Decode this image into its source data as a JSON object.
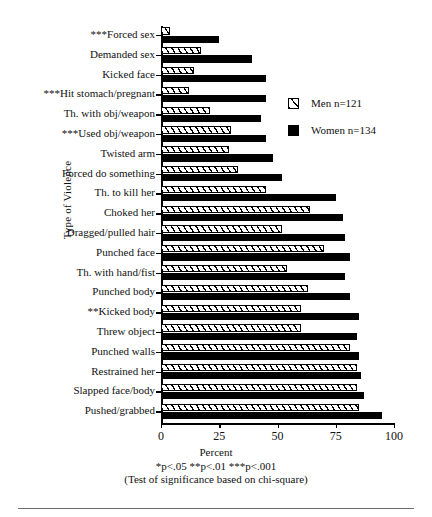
{
  "chart_data": {
    "type": "bar",
    "orientation": "horizontal",
    "title": "",
    "xlabel": "Percent",
    "ylabel": "Type of Violence",
    "xlim": [
      0,
      100
    ],
    "xticks": [
      0,
      25,
      50,
      75,
      100
    ],
    "grid": false,
    "legend_position": "upper right",
    "categories": [
      "***Forced sex",
      "Demanded sex",
      "Kicked face",
      "***Hit stomach/pregnant",
      "Th. with obj/weapon",
      "***Used obj/weapon",
      "Twisted arm",
      "Forced do something",
      "Th. to kill her",
      "Choked her",
      "Dragged/pulled hair",
      "Punched face",
      "Th. with hand/fist",
      "Punched body",
      "**Kicked body",
      "Threw object",
      "Punched walls",
      "Restrained her",
      "Slapped face/body",
      "Pushed/grabbed"
    ],
    "series": [
      {
        "name": "Men n=121",
        "pattern": "hatched",
        "values": [
          4,
          17,
          14,
          12,
          21,
          30,
          29,
          33,
          45,
          64,
          52,
          70,
          54,
          63,
          60,
          60,
          81,
          84,
          84,
          85
        ]
      },
      {
        "name": "Women n=134",
        "pattern": "solid",
        "color": "#000000",
        "values": [
          25,
          39,
          45,
          45,
          43,
          45,
          48,
          52,
          75,
          78,
          79,
          81,
          79,
          81,
          85,
          84,
          85,
          86,
          87,
          95
        ]
      }
    ],
    "annotations": [
      "*p<.05 **p<.01 ***p<.001",
      "(Test of significance based on  chi-square)"
    ]
  },
  "legend": {
    "items": [
      {
        "label": "Men n=121",
        "swatch": "hatched-square-icon"
      },
      {
        "label": "Women n=134",
        "swatch": "filled-square-icon"
      }
    ]
  },
  "footer": {
    "xlabel": "Percent",
    "significance": "*p<.05 **p<.01 ***p<.001",
    "test_note": "(Test of significance based on  chi-square)"
  }
}
